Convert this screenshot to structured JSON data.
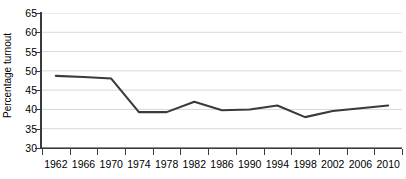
{
  "chart_data": {
    "type": "line",
    "title": "",
    "xlabel": "",
    "ylabel": "Percentage turnout",
    "categories": [
      "1962",
      "1966",
      "1970",
      "1974",
      "1978",
      "1982",
      "1986",
      "1990",
      "1994",
      "1998",
      "2002",
      "2006",
      "2010"
    ],
    "values": [
      48.7,
      48.4,
      48.0,
      39.3,
      39.3,
      42.0,
      39.8,
      40.0,
      41.0,
      38.0,
      39.6,
      40.3,
      41.0
    ],
    "series": [
      {
        "name": "Percentage turnout",
        "values": [
          48.7,
          48.4,
          48.0,
          39.3,
          39.3,
          42.0,
          39.8,
          40.0,
          41.0,
          38.0,
          39.6,
          40.3,
          41.0
        ]
      }
    ],
    "ylim": [
      30,
      65
    ],
    "ytick_values": [
      30,
      35,
      40,
      45,
      50,
      55,
      60,
      65
    ],
    "ytick_labels": [
      "30",
      "35",
      "40",
      "45",
      "50",
      "55",
      "60",
      "65"
    ],
    "grid": true,
    "grid_axis": "y",
    "legend": "none",
    "line_color": "#3a3a3a",
    "grid_color": "#d9d9d9",
    "axis_color": "#3a3a3a",
    "background_color": "#ffffff"
  }
}
